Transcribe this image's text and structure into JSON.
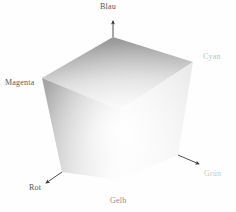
{
  "figure": {
    "background_color": "#fefefe",
    "type": "rgb-color-cube-diagram",
    "rendering": "grayscale"
  },
  "labels": {
    "blau": {
      "text": "Blau",
      "color": "#555555",
      "corner": "top"
    },
    "cyan": {
      "text": "Cyan",
      "color": "#b9c4c8",
      "corner": "upper-right"
    },
    "magenta": {
      "text": "Magenta",
      "color": "#5a5a5a",
      "corner": "left"
    },
    "rot": {
      "text": "Rot",
      "color": "#555555",
      "corner": "lower-left"
    },
    "gelb": {
      "text": "Gelb",
      "color": "#8e8e8e",
      "corner": "bottom"
    },
    "gruen": {
      "text": "Grün",
      "color": "#c3cfc3",
      "corner": "lower-right"
    }
  },
  "geometry": {
    "vertices": {
      "top": [
        113,
        37
      ],
      "left": [
        42,
        78
      ],
      "upper_right": [
        193,
        62
      ],
      "lower_left": [
        62,
        172
      ],
      "bottom": [
        120,
        180
      ],
      "lower_right": [
        178,
        155
      ],
      "center": [
        116,
        110
      ]
    },
    "faces": [
      {
        "name": "top-face",
        "shading": "dark-at-top-vertex",
        "from": "#9b9b9b",
        "to": "#f2f2f2"
      },
      {
        "name": "left-face",
        "shading": "dark-at-left-edge",
        "from": "#a6a6a6",
        "to": "#fbfbfb"
      },
      {
        "name": "right-face",
        "shading": "light",
        "from": "#f0f0f0",
        "to": "#ffffff"
      }
    ]
  },
  "axes": [
    {
      "name": "blau-axis",
      "direction": "up",
      "arrow": true
    },
    {
      "name": "rot-axis",
      "direction": "down-left",
      "arrow": true
    },
    {
      "name": "gruen-axis",
      "direction": "down-right",
      "arrow": true
    }
  ]
}
